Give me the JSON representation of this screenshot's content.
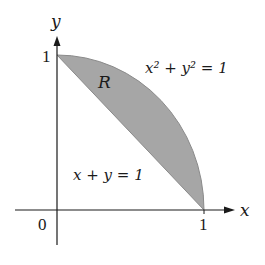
{
  "diagram": {
    "axes": {
      "x_label": "x",
      "y_label": "y",
      "origin_label": "0",
      "x_tick_label": "1",
      "y_tick_label": "1"
    },
    "curves": {
      "circle_label": "x² + y² = 1",
      "line_label": "x + y = 1"
    },
    "region": {
      "label": "R",
      "fill_color": "#a6a6a6",
      "description": "Region between the line x + y = 1 and the quarter circle x² + y² = 1 in the first quadrant"
    },
    "colors": {
      "axis": "#1a1a1a",
      "region_fill": "#a6a6a6",
      "region_stroke": "#8a8a8a",
      "background": "#ffffff"
    }
  }
}
